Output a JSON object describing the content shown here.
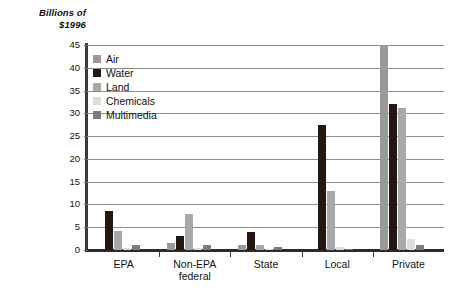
{
  "chart_data": {
    "type": "bar",
    "title": "Billions of\n$1996",
    "ylabel": "Billions of $1996",
    "xlabel": "",
    "ylim": [
      0,
      45
    ],
    "yticks": [
      0,
      5,
      10,
      15,
      20,
      25,
      30,
      35,
      40,
      45
    ],
    "ytick_labels": [
      "0",
      "5",
      "10",
      "15",
      "20",
      "25",
      "30",
      "35",
      "40",
      "45"
    ],
    "grid": true,
    "legend_position": "upper-left-inside",
    "categories": [
      "EPA",
      "Non-EPA\nfederal",
      "State",
      "Local",
      "Private"
    ],
    "category_labels": [
      "EPA",
      "Non-EPA federal",
      "State",
      "Local",
      "Private"
    ],
    "series": [
      {
        "name": "Air",
        "color": "#9a9a9a",
        "values": [
          0,
          1.6,
          1.2,
          0,
          45.0
        ]
      },
      {
        "name": "Water",
        "color": "#231712",
        "values": [
          8.6,
          3.0,
          4.0,
          27.5,
          32.0
        ]
      },
      {
        "name": "Land",
        "color": "#a8a8a8",
        "values": [
          4.1,
          8.0,
          1.1,
          13.0,
          31.2
        ]
      },
      {
        "name": "Chemicals",
        "color": "#dcdcdc",
        "values": [
          0.4,
          0.5,
          0.3,
          0.7,
          2.5
        ]
      },
      {
        "name": "Multimedia",
        "color": "#7d7d7d",
        "values": [
          1.2,
          1.1,
          0.7,
          0.3,
          1.1
        ]
      }
    ]
  },
  "colors": {
    "axis": "#2b2b2b",
    "gridline": "#8d8d8d",
    "text": "#111111",
    "background": "#ffffff"
  }
}
